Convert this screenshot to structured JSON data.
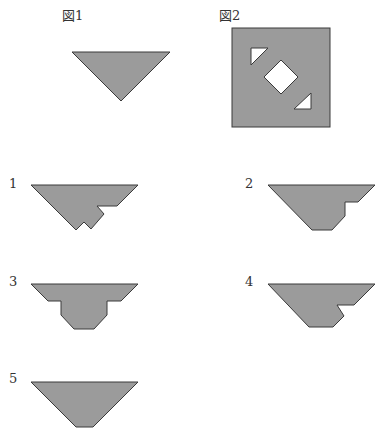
{
  "figures": {
    "fig1": {
      "label": "図1"
    },
    "fig2": {
      "label": "図2"
    }
  },
  "options": [
    {
      "number": "1"
    },
    {
      "number": "2"
    },
    {
      "number": "3"
    },
    {
      "number": "4"
    },
    {
      "number": "5"
    }
  ],
  "colors": {
    "shape_fill": "#9b9b9b",
    "shape_stroke": "#3a3a3a",
    "hole_fill": "#ffffff",
    "background": "#ffffff"
  }
}
